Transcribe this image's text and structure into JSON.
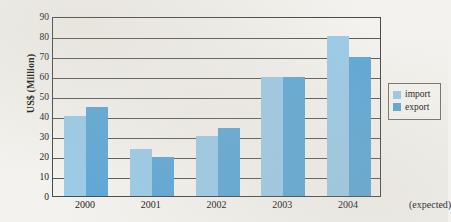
{
  "chart_data": {
    "type": "bar",
    "title": "",
    "subtitle": "",
    "xlabel": "",
    "ylabel": "US$ (Million)",
    "categories": [
      "2000",
      "2001",
      "2002",
      "2003",
      "2004"
    ],
    "series": [
      {
        "name": "import",
        "color": "#9ccbe8",
        "values": [
          40,
          23.5,
          30,
          59.5,
          80
        ]
      },
      {
        "name": "export",
        "color": "#5ea8d7",
        "values": [
          44.5,
          19.5,
          34,
          59.5,
          69.5
        ]
      }
    ],
    "ylim": [
      0,
      90
    ],
    "ytick_step": 10,
    "yticks": [
      "0",
      "10",
      "20",
      "30",
      "40",
      "50",
      "60",
      "70",
      "80",
      "90"
    ],
    "grid": true,
    "grid_axis": "y",
    "legend_position": "right",
    "annotations": [
      {
        "name": "expected-note",
        "text": "(expected)"
      }
    ]
  },
  "axes": {
    "y_title": "US$ (Million)"
  },
  "legend": {
    "entries": [
      {
        "label": "import",
        "color": "#9ccbe8"
      },
      {
        "label": "export",
        "color": "#5ea8d7"
      }
    ]
  },
  "x_axis": {
    "labels": [
      "2000",
      "2001",
      "2002",
      "2003",
      "2004"
    ],
    "note": "(expected)"
  }
}
